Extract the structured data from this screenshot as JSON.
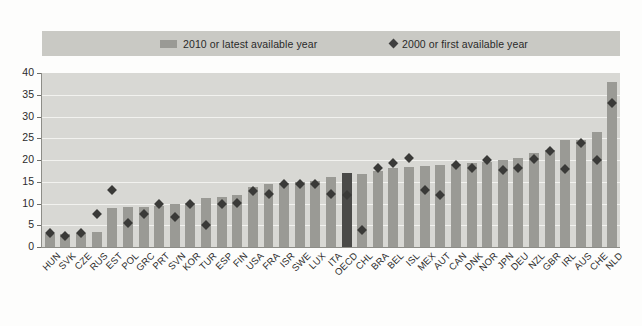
{
  "legend": {
    "items": [
      {
        "label": "2010 or latest available year",
        "marker": "square-swatch",
        "color": "#9a9a95"
      },
      {
        "label": "2000 or first available year",
        "marker": "diamond-marker",
        "color": "#3f3f3f"
      }
    ]
  },
  "axis": {
    "y_ticks": [
      "0",
      "5",
      "10",
      "15",
      "20",
      "25",
      "30",
      "35",
      "40"
    ]
  },
  "chart_data": {
    "type": "bar",
    "title": "",
    "subtitle": "",
    "xlabel": "",
    "ylabel": "",
    "ylim": [
      0,
      40
    ],
    "ytick_step": 5,
    "grid": true,
    "legend_position": "top",
    "highlight_category": "OECD",
    "highlight_color": "#4a4a48",
    "bar_color": "#9a9a95",
    "marker_color": "#3a3a38",
    "categories": [
      "HUN",
      "SVK",
      "CZE",
      "RUS",
      "EST",
      "POL",
      "GRC",
      "PRT",
      "SVN",
      "KOR",
      "TUR",
      "ESP",
      "FIN",
      "USA",
      "FRA",
      "ISR",
      "SWE",
      "LUX",
      "ITA",
      "OECD",
      "CHL",
      "BRA",
      "BEL",
      "ISL",
      "MEX",
      "AUT",
      "CAN",
      "DNK",
      "NOR",
      "JPN",
      "DEU",
      "NZL",
      "GBR",
      "IRL",
      "AUS",
      "CHE",
      "NLD"
    ],
    "series": [
      {
        "name": "2010 or latest available year",
        "type": "bar",
        "values": [
          3.0,
          3.0,
          3.2,
          3.5,
          9.0,
          9.2,
          9.3,
          9.5,
          10.0,
          10.2,
          11.2,
          11.5,
          12.0,
          13.8,
          14.5,
          14.8,
          15.0,
          15.2,
          16.0,
          17.0,
          16.8,
          17.5,
          18.2,
          18.5,
          18.7,
          18.8,
          19.0,
          19.2,
          19.5,
          20.0,
          20.5,
          21.5,
          22.3,
          24.5,
          24.5,
          26.5,
          38.0
        ]
      },
      {
        "name": "2000 or first available year",
        "type": "scatter",
        "values": [
          3.2,
          2.5,
          3.2,
          7.5,
          13.0,
          5.5,
          7.5,
          9.8,
          6.8,
          9.8,
          5.0,
          9.8,
          10.2,
          12.8,
          12.2,
          14.5,
          14.5,
          14.5,
          12.2,
          12.0,
          4.0,
          18.2,
          19.2,
          20.5,
          13.0,
          12.0,
          18.8,
          18.2,
          20.0,
          17.8,
          18.2,
          20.2,
          22.0,
          18.0,
          23.8,
          20.0,
          33.0
        ]
      }
    ]
  }
}
